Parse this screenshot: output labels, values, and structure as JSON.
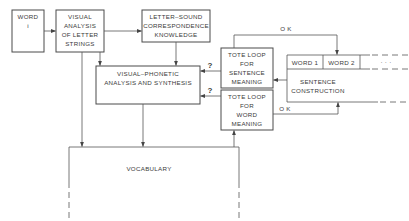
{
  "diagram": {
    "nodes": {
      "word_i": {
        "lines": [
          "WORD",
          "i"
        ]
      },
      "visual_analysis": {
        "lines": [
          "VISUAL",
          "ANALYSIS",
          "OF LETTER",
          "STRINGS"
        ]
      },
      "letter_sound": {
        "lines": [
          "LETTER–SOUND",
          "CORRESPONDENCE",
          "KNOWLEDGE"
        ]
      },
      "visual_phonetic": {
        "lines": [
          "VISUAL–PHONETIC",
          "ANALYSIS AND SYNTHESIS"
        ]
      },
      "tote_sentence": {
        "lines": [
          "TOTE LOOP",
          "FOR",
          "SENTENCE",
          "MEANING"
        ]
      },
      "tote_word": {
        "lines": [
          "TOTE LOOP",
          "FOR",
          "WORD",
          "MEANING"
        ]
      },
      "sentence_construction": {
        "slots": [
          "WORD 1",
          "WORD 2",
          "·  ·  ·"
        ],
        "lines": [
          "SENTENCE",
          "CONSTRUCTION"
        ]
      },
      "vocabulary": {
        "lines": [
          "VOCABULARY"
        ]
      }
    },
    "edge_labels": {
      "ok_top": "O K",
      "ok_bottom": "O K",
      "q_sentence": "?",
      "q_word": "?"
    }
  }
}
